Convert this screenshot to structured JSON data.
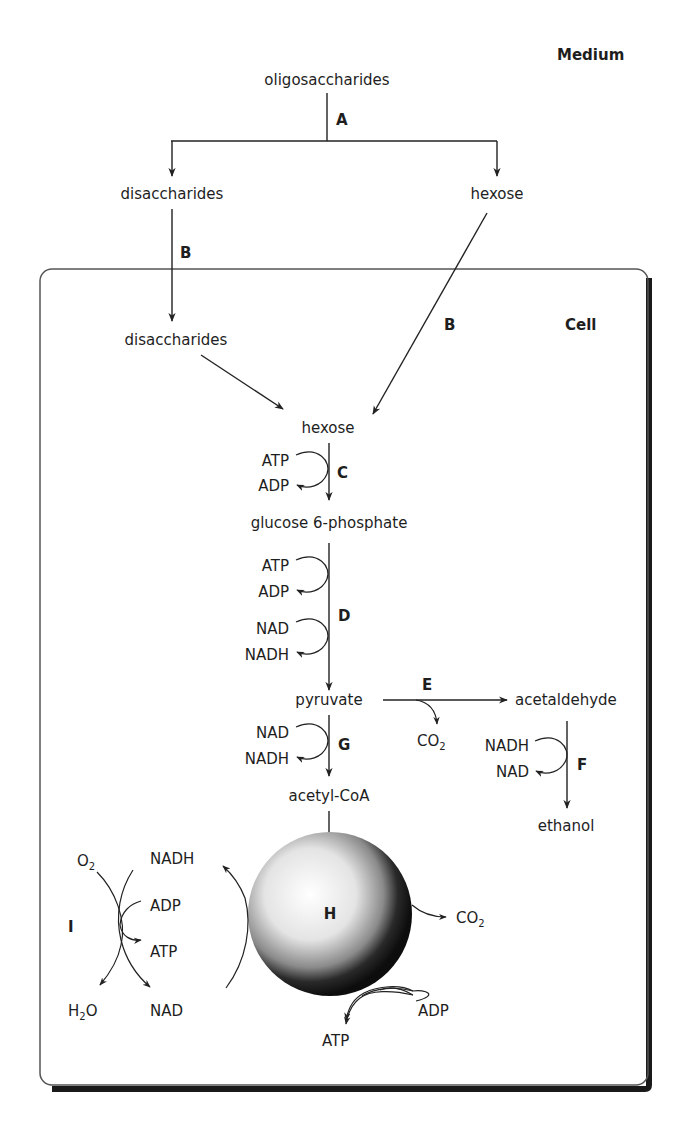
{
  "compartments": {
    "medium": "Medium",
    "cell": "Cell"
  },
  "colors": {
    "line": "#222222",
    "text": "#1e1e1e",
    "cell_border": "#555555",
    "cell_shadow": "#1a1a1a",
    "sphere_light": "#ffffff",
    "sphere_dark": "#111111"
  },
  "medium": {
    "oligosaccharides": "oligosaccharides",
    "disaccharides": "disaccharides",
    "hexose": "hexose"
  },
  "cell": {
    "disaccharides": "disaccharides",
    "hexose": "hexose",
    "glucose6p": "glucose 6-phosphate",
    "pyruvate": "pyruvate",
    "acetaldehyde": "acetaldehyde",
    "ethanol": "ethanol",
    "acetylcoa": "acetyl-CoA"
  },
  "steps": {
    "A": "A",
    "B_left": "B",
    "B_right": "B",
    "C": "C",
    "D": "D",
    "E": "E",
    "F": "F",
    "G": "G",
    "H": "H",
    "I": "I"
  },
  "cofactors": {
    "C": {
      "in": "ATP",
      "out": "ADP"
    },
    "D1": {
      "in": "ATP",
      "out": "ADP"
    },
    "D2": {
      "in": "NAD",
      "out": "NADH"
    },
    "E": {
      "co2_main": "CO",
      "co2_sub": "2"
    },
    "F": {
      "in": "NADH",
      "out": "NAD"
    },
    "G": {
      "in": "NAD",
      "out": "NADH"
    },
    "H": {
      "co2_main": "CO",
      "co2_sub": "2",
      "adp": "ADP",
      "atp": "ATP"
    },
    "I": {
      "o2_main": "O",
      "o2_sub": "2",
      "nadh": "NADH",
      "adp": "ADP",
      "atp": "ATP",
      "h2o_pre": "H",
      "h2o_sub": "2",
      "h2o_post": "O",
      "nad": "NAD"
    }
  }
}
